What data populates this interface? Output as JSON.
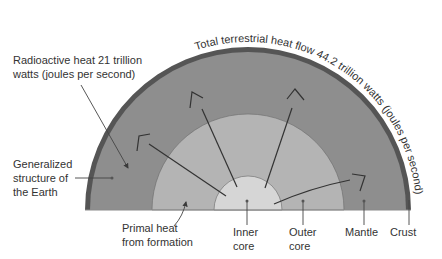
{
  "diagram": {
    "title": "Generalized structure of the Earth",
    "colors": {
      "crust": "#555555",
      "mantle": "#8e8e8e",
      "outer_core": "#b4b4b4",
      "inner_core": "#d6d6d6",
      "line": "#3a3a3a",
      "text": "#333333"
    },
    "labels": {
      "radioactive_line1": "Radioactive heat 21 trillion",
      "radioactive_line2": "watts (joules per second)",
      "total_heat": "Total terrestrial heat flow 44.2 trillion watts (joules per second)",
      "structure_line1": "Generalized",
      "structure_line2": "structure of",
      "structure_line3": "the Earth",
      "primal_line1": "Primal heat",
      "primal_line2": "from formation",
      "inner_core_line1": "Inner",
      "inner_core_line2": "core",
      "outer_core_line1": "Outer",
      "outer_core_line2": "core",
      "mantle": "Mantle",
      "crust": "Crust"
    }
  }
}
